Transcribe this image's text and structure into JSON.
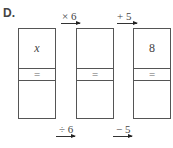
{
  "label": "D.",
  "boxes": [
    {
      "top": "x",
      "middle": "=",
      "bottom": ""
    },
    {
      "top": "",
      "middle": "=",
      "bottom": ""
    },
    {
      "top": "8",
      "middle": "=",
      "bottom": ""
    }
  ],
  "forward_operations": [
    {
      "label": "× 6",
      "from": 1,
      "to": 2
    },
    {
      "label": "+ 5",
      "from": 2,
      "to": 3
    }
  ],
  "inverse_operations": [
    {
      "label": "÷ 6",
      "between": [
        1,
        2
      ]
    },
    {
      "label": "− 5",
      "between": [
        2,
        3
      ]
    }
  ]
}
